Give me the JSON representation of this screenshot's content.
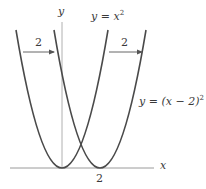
{
  "diagram": {
    "axes": {
      "x_label": "x",
      "y_label": "y",
      "x_tick_label": "2"
    },
    "curves": [
      {
        "name": "original",
        "label_lhs": "y = ",
        "label_var": "x",
        "label_exp": "2",
        "equation": "y = x^2",
        "vertex_x": 0
      },
      {
        "name": "shifted",
        "label_lhs": "y = ",
        "label_body": "(x − 2)",
        "label_exp": "2",
        "equation": "y = (x - 2)^2",
        "vertex_x": 2
      }
    ],
    "arrows": [
      {
        "label": "2",
        "direction": "right"
      },
      {
        "label": "2",
        "direction": "right"
      }
    ],
    "colors": {
      "curve": "#4a4a4a",
      "axis": "#9a9a9a",
      "arrow": "#555555",
      "text": "#3a3a3a"
    }
  }
}
